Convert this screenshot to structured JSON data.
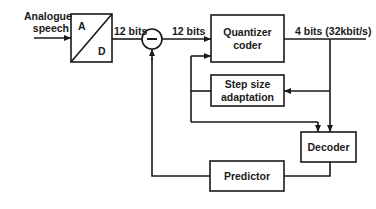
{
  "diagram": {
    "type": "block-diagram",
    "input_label": [
      "Analogue",
      "speech"
    ],
    "adc": {
      "top_label": "A",
      "bottom_label": "D"
    },
    "adc_output_label": "12 bits",
    "subtractor_symbol": "−",
    "subtractor_output_label": "12 bits",
    "quantizer": [
      "Quantizer",
      "coder"
    ],
    "output_label": "4 bits (32kbit/s)",
    "step_size": [
      "Step size",
      "adaptation"
    ],
    "decoder": "Decoder",
    "predictor": "Predictor",
    "colors": {
      "line": "#1a1a1a",
      "background": "#ffffff"
    }
  }
}
